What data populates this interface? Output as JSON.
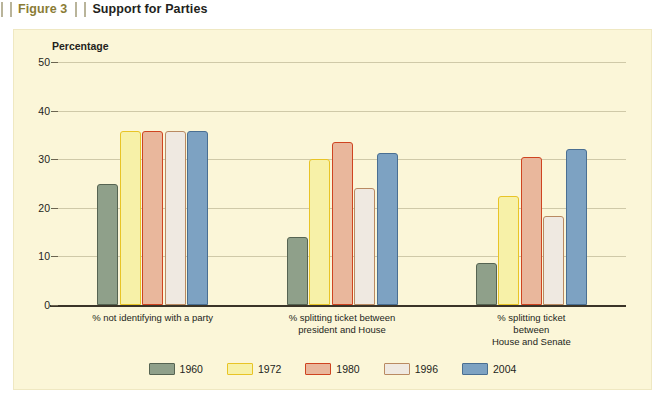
{
  "header": {
    "figure_number": "Figure 3",
    "title": "Support for Parties"
  },
  "chart_data": {
    "type": "bar",
    "title": "Support for Parties",
    "axis_title": "Percentage",
    "xlabel": "",
    "ylabel": "Percentage",
    "ylim": [
      0,
      50
    ],
    "yticks": [
      0,
      10,
      20,
      30,
      40,
      50
    ],
    "grid": true,
    "legend_position": "bottom",
    "categories": [
      "% not identifying with a party",
      "% splitting ticket between\npresident and House",
      "% splitting ticket between\nHouse and Senate"
    ],
    "series": [
      {
        "name": "1960",
        "color": "#8fa08a",
        "border": "#566452",
        "values": [
          24.8,
          14.0,
          8.7
        ]
      },
      {
        "name": "1972",
        "color": "#f7f1a8",
        "border": "#e8c426",
        "values": [
          35.8,
          30.0,
          22.5
        ]
      },
      {
        "name": "1980",
        "color": "#e9b79c",
        "border": "#cf4420",
        "values": [
          35.9,
          33.6,
          30.5
        ]
      },
      {
        "name": "1996",
        "color": "#efe9e1",
        "border": "#b98a62",
        "values": [
          35.9,
          24.0,
          18.4
        ]
      },
      {
        "name": "2004",
        "color": "#7da2c2",
        "border": "#4a6f92",
        "values": [
          35.8,
          31.3,
          32.0
        ]
      }
    ]
  }
}
